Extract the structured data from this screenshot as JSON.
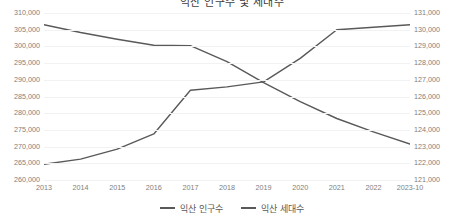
{
  "chart_data": {
    "type": "line",
    "title": "익산 인구수 및 세대수",
    "xlabel": "",
    "ylabel": "",
    "grid": true,
    "legend_position": "bottom",
    "categories": [
      "2013",
      "2014",
      "2015",
      "2016",
      "2017",
      "2018",
      "2019",
      "2020",
      "2021",
      "2022",
      "2023-10"
    ],
    "axes": {
      "left": {
        "label": "익산 인구수",
        "min": 260000,
        "max": 310000,
        "step": 5000,
        "ticks": [
          "260,000",
          "265,000",
          "270,000",
          "275,000",
          "280,000",
          "285,000",
          "290,000",
          "295,000",
          "300,000",
          "305,000",
          "310,000"
        ]
      },
      "right": {
        "label": "익산 세대수",
        "min": 121000,
        "max": 131000,
        "step": 1000,
        "ticks": [
          "121,000",
          "122,000",
          "123,000",
          "124,000",
          "125,000",
          "126,000",
          "127,000",
          "128,000",
          "129,000",
          "130,000",
          "131,000"
        ]
      }
    },
    "series": [
      {
        "name": "익산 인구수",
        "axis": "left",
        "color": "#595959",
        "values": [
          306500,
          304200,
          302200,
          300400,
          300300,
          295500,
          289300,
          283600,
          278600,
          274600,
          271000
        ]
      },
      {
        "name": "익산 세대수",
        "axis": "right",
        "color": "#595959",
        "values": [
          122000,
          122300,
          122900,
          123800,
          126400,
          126600,
          126900,
          128300,
          130000,
          130150,
          130300
        ]
      }
    ]
  },
  "legend": {
    "items": [
      {
        "label": "익산 인구수"
      },
      {
        "label": "익산 세대수"
      }
    ]
  }
}
